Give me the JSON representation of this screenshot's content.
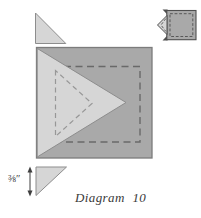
{
  "figure": {
    "caption": "Diagram 10",
    "measurement_label": "⅜″",
    "colors": {
      "page_bg": "#ffffff",
      "square_fill": "#a9a9a9",
      "square_stroke": "#7c7c7c",
      "triangle_fill": "#d6d6d6",
      "triangle_stroke": "#8d8d8d",
      "seam_dark": "#696969",
      "seam_light": "#979797",
      "inset_stroke": "#4f4f4f",
      "arrow": "#3f3f3f",
      "text_color": "#3a3a3a"
    }
  }
}
